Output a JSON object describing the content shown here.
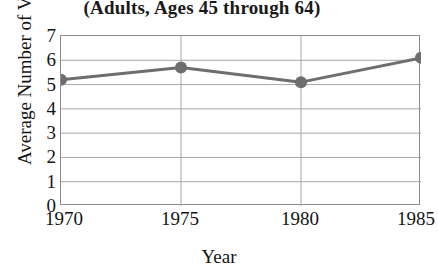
{
  "chart_data": {
    "type": "line",
    "title": "(Adults, Ages 45 through 64)",
    "xlabel": "Year",
    "ylabel": "Average Number of Visits",
    "x": [
      1970,
      1975,
      1980,
      1985
    ],
    "categories": [
      "1970",
      "1975",
      "1980",
      "1985"
    ],
    "values": [
      5.2,
      5.7,
      5.1,
      6.1
    ],
    "series": [
      {
        "name": "Average Number of Visits",
        "values": [
          5.2,
          5.7,
          5.1,
          6.1
        ]
      }
    ],
    "xlim": [
      1970,
      1985
    ],
    "ylim": [
      0,
      7
    ],
    "y_ticks": [
      7,
      6,
      5,
      4,
      3,
      2,
      1,
      0
    ],
    "y_tick_labels": [
      "7",
      "6",
      "5",
      "4",
      "3",
      "2",
      "1",
      "0"
    ],
    "x_ticks": [
      1970,
      1975,
      1980,
      1985
    ],
    "x_tick_labels": [
      "1970",
      "1975",
      "1980",
      "1985"
    ],
    "grid": true,
    "grid_x": true,
    "grid_y": true,
    "legend": false,
    "legend_position": "none",
    "marker": "circle",
    "line_color": "#6e6e6e",
    "marker_color": "#6e6e6e",
    "grid_color": "#a8a8a8",
    "axis_color": "#8d8d8d",
    "text_color": "#141414",
    "background_color": "#ffffff"
  }
}
